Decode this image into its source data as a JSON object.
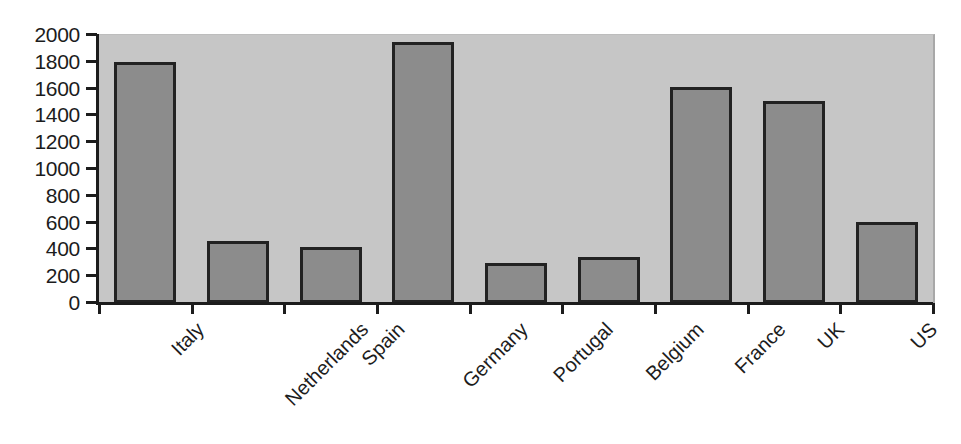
{
  "chart_data": {
    "type": "bar",
    "title": "",
    "subtitle": "",
    "xlabel": "",
    "ylabel": "",
    "categories": [
      "Italy",
      "Netherlands",
      "Spain",
      "Germany",
      "Portugal",
      "Belgium",
      "France",
      "UK",
      "US"
    ],
    "values": [
      1800,
      460,
      415,
      1950,
      295,
      340,
      1610,
      1510,
      605
    ],
    "series": [
      {
        "name": "Series 1",
        "values": [
          1800,
          460,
          415,
          1950,
          295,
          340,
          1610,
          1510,
          605
        ]
      }
    ],
    "ylim": [
      0,
      2000
    ],
    "ytick_labels": [
      "2000",
      "1800",
      "1600",
      "1400",
      "1200",
      "1000",
      "800",
      "600",
      "400",
      "200",
      "0"
    ],
    "ytick_values": [
      2000,
      1800,
      1600,
      1400,
      1200,
      1000,
      800,
      600,
      400,
      200,
      0
    ],
    "grid": false,
    "legend": false,
    "legend_position": "none",
    "annotations": [],
    "colors": {
      "bar_fill": "#8c8c8c",
      "bar_stroke": "#222222",
      "plot_background": "#c6c6c6",
      "axis": "#1c1c1c",
      "page_background": "#ffffff",
      "text": "#1c1c1c"
    },
    "label_rotation_degrees": -45
  }
}
